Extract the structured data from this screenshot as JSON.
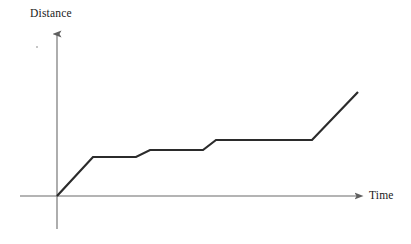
{
  "figure": {
    "background_color": "#ffffff",
    "width": 411,
    "height": 244
  },
  "labels": {
    "y_axis": "Distance",
    "x_axis": "Time"
  },
  "style": {
    "axis_color": "#6b6b6b",
    "data_line_color": "#2b2b2b",
    "data_line_width": 2.2,
    "axis_line_width": 1.1
  },
  "axes_geometry": {
    "origin": [
      57,
      196
    ],
    "y_axis_top": [
      57,
      30
    ],
    "y_axis_bottom": [
      57,
      229
    ],
    "x_axis_left": [
      20,
      196
    ],
    "x_axis_right": [
      363,
      196
    ]
  },
  "chart_data": {
    "type": "line",
    "title": "",
    "xlabel": "Time",
    "ylabel": "Distance",
    "grid": false,
    "legend": null,
    "xlim": [
      0,
      100
    ],
    "ylim": [
      0,
      100
    ],
    "x_tick_labels": [],
    "y_tick_labels": [],
    "series": [
      {
        "name": "distance",
        "x": [
          0,
          11.8,
          25.9,
          30.5,
          47.8,
          52.1,
          83.6,
          98.7
        ],
        "y": [
          0,
          23.5,
          23.5,
          27.7,
          27.7,
          33.7,
          33.7,
          62.7
        ],
        "points_px": [
          [
            57,
            196
          ],
          [
            93,
            157
          ],
          [
            136,
            157
          ],
          [
            150,
            150
          ],
          [
            203,
            150
          ],
          [
            216,
            140
          ],
          [
            312,
            140
          ],
          [
            358,
            92
          ]
        ],
        "segments": [
          {
            "kind": "rise",
            "from_px": [
              57,
              196
            ],
            "to_px": [
              93,
              157
            ]
          },
          {
            "kind": "flat",
            "from_px": [
              93,
              157
            ],
            "to_px": [
              136,
              157
            ]
          },
          {
            "kind": "rise",
            "from_px": [
              136,
              157
            ],
            "to_px": [
              150,
              150
            ]
          },
          {
            "kind": "flat",
            "from_px": [
              150,
              150
            ],
            "to_px": [
              203,
              150
            ]
          },
          {
            "kind": "rise",
            "from_px": [
              203,
              150
            ],
            "to_px": [
              216,
              140
            ]
          },
          {
            "kind": "flat",
            "from_px": [
              216,
              140
            ],
            "to_px": [
              312,
              140
            ]
          },
          {
            "kind": "rise",
            "from_px": [
              312,
              140
            ],
            "to_px": [
              358,
              92
            ]
          }
        ]
      }
    ]
  },
  "artifacts": {
    "speck": {
      "x": 36,
      "y": 46
    }
  }
}
